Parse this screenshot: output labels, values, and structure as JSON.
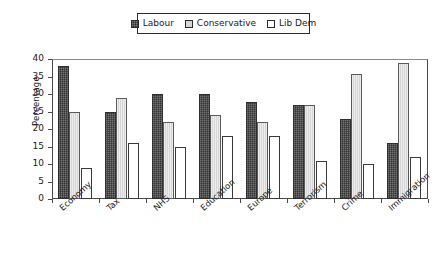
{
  "chart_data": {
    "type": "bar",
    "title": "",
    "xlabel": "",
    "ylabel": "Percentage",
    "ylim": [
      0,
      40
    ],
    "ytick_step": 5,
    "yticks": [
      "0",
      "5",
      "10",
      "15",
      "20",
      "25",
      "30",
      "35",
      "40"
    ],
    "grid": false,
    "legend_position": "top-center",
    "categories": [
      "Economy",
      "Tax",
      "NHS",
      "Education",
      "Europe",
      "Terrorism",
      "Crime",
      "Immigration"
    ],
    "series": [
      {
        "name": "Labour",
        "color": "#4d4d4d",
        "values": [
          38,
          25,
          30,
          30,
          27.8,
          27,
          23,
          16
        ]
      },
      {
        "name": "Conservative",
        "color": "#d6d6d6",
        "values": [
          25,
          28.8,
          22,
          24,
          22,
          27,
          35.8,
          39
        ]
      },
      {
        "name": "Lib Dem",
        "color": "#ffffff",
        "values": [
          9,
          16,
          15,
          18,
          18,
          11,
          10,
          12
        ]
      }
    ]
  },
  "legend": {
    "items": [
      {
        "label": "Labour",
        "swatch": "labour-swatch-icon"
      },
      {
        "label": "Conservative",
        "swatch": "conservative-swatch-icon"
      },
      {
        "label": "Lib Dem",
        "swatch": "libdem-swatch-icon"
      }
    ]
  },
  "axes": {
    "y_label": "Percentage"
  }
}
